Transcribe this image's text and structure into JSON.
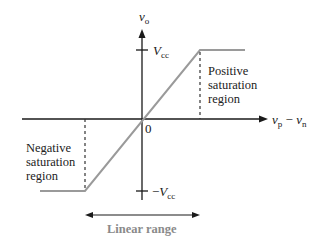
{
  "diagram": {
    "y_axis": {
      "label_main": "v",
      "label_sub": "o"
    },
    "x_axis": {
      "label_a_main": "v",
      "label_a_sub": "p",
      "minus": "−",
      "label_b_main": "v",
      "label_b_sub": "n"
    },
    "origin_label": "0",
    "vcc_pos": {
      "main": "V",
      "sub": "cc"
    },
    "vcc_neg": {
      "sign": "−",
      "main": "V",
      "sub": "cc"
    },
    "positive_region": {
      "line1": "Positive",
      "line2": "saturation",
      "line3": "region"
    },
    "negative_region": {
      "line1": "Negative",
      "line2": "saturation",
      "line3": "region"
    },
    "linear_range_label": "Linear range",
    "colors": {
      "axis": "#1a1a1a",
      "curve": "#9a9a9a",
      "linear_label": "#8a8a8a",
      "background": "#ffffff"
    }
  }
}
